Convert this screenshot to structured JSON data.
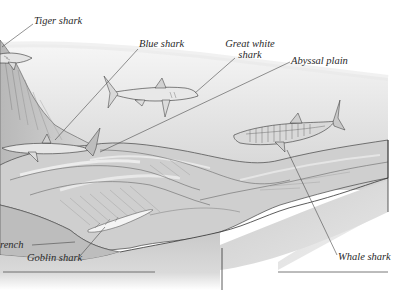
{
  "diagram": {
    "type": "ocean-depth-illustration",
    "labels": {
      "tiger_shark": "Tiger shark",
      "blue_shark": "Blue shark",
      "great_white_line1": "Great white",
      "great_white_line2": "shark",
      "abyssal_plain": "Abyssal plain",
      "whale_shark": "Whale shark",
      "goblin_shark": "Goblin shark",
      "trench": "rench"
    },
    "colors": {
      "background": "#ffffff",
      "water_light": "#ededed",
      "water_mid": "#d6d6d6",
      "seabed": "#c4c4c4",
      "seabed_dark": "#9a9a9a",
      "outline": "#3a3a3a",
      "leader_line": "#4a4a4a",
      "shark_fill": "#e2e2e2"
    }
  }
}
